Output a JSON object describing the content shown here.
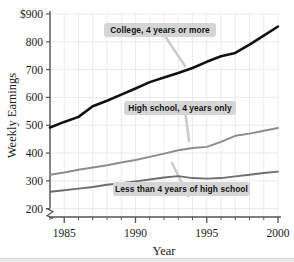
{
  "chart_data": {
    "type": "line",
    "title": "",
    "xlabel": "Year",
    "ylabel": "Weekly Earnings",
    "xlim": [
      1984,
      2000
    ],
    "ylim": [
      170,
      900
    ],
    "y_axis_break": true,
    "grid": true,
    "legend_position": "inline-annotations",
    "x_ticks_major": [
      "1985",
      "1990",
      "1995",
      "2000"
    ],
    "x_ticks_major_values": [
      1985,
      1990,
      1995,
      2000
    ],
    "x_ticks_minor_values": [
      1984,
      1986,
      1987,
      1988,
      1989,
      1991,
      1992,
      1993,
      1994,
      1996,
      1997,
      1998,
      1999
    ],
    "y_ticks": [
      "$900",
      "800",
      "700",
      "600",
      "500",
      "400",
      "300",
      "200"
    ],
    "y_tick_values": [
      900,
      800,
      700,
      600,
      500,
      400,
      300,
      200
    ],
    "x": [
      1984,
      1985,
      1986,
      1987,
      1988,
      1989,
      1990,
      1991,
      1992,
      1993,
      1994,
      1995,
      1996,
      1997,
      1998,
      1999,
      2000
    ],
    "series": [
      {
        "name": "College, 4 years or more",
        "color": "#111111",
        "width": 2.6,
        "values": [
          492,
          512,
          530,
          568,
          588,
          610,
          632,
          655,
          672,
          688,
          706,
          728,
          748,
          760,
          790,
          822,
          855
        ]
      },
      {
        "name": "High school, 4 years only",
        "color": "#8c8c8c",
        "width": 1.9,
        "values": [
          322,
          330,
          340,
          348,
          356,
          366,
          375,
          386,
          398,
          410,
          418,
          422,
          440,
          462,
          470,
          480,
          490
        ]
      },
      {
        "name": "Less than 4 years of high school",
        "color": "#6e6e6e",
        "width": 1.9,
        "values": [
          261,
          266,
          272,
          278,
          286,
          292,
          298,
          305,
          312,
          317,
          310,
          308,
          310,
          316,
          322,
          328,
          333
        ]
      }
    ],
    "annotations": [
      {
        "text": "College, 4 years or more",
        "box_x": 104,
        "box_y": 23,
        "box_w": 112,
        "box_h": 14,
        "leader_to_x": 185,
        "leader_to_y": 66
      },
      {
        "text": "High school, 4 years only",
        "box_x": 124,
        "box_y": 101,
        "box_w": 112,
        "box_h": 14,
        "leader_to_x": 189,
        "leader_to_y": 141
      },
      {
        "text": "Less than 4 years of high school",
        "box_x": 113,
        "box_y": 182,
        "box_w": 137,
        "box_h": 14,
        "leader_to_x": 172,
        "leader_to_y": 163
      }
    ]
  },
  "style": {
    "axis_color": "#555555",
    "grid_color": "#ebebeb",
    "annotation_box_fill": "#d5d5d5",
    "annotation_text_color": "#141414",
    "leader_color": "#cccccc",
    "background": "#ffffff"
  }
}
